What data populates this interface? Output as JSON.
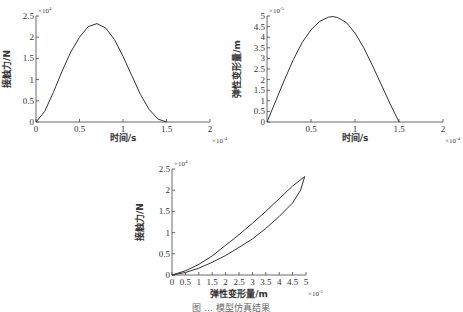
{
  "chart_data": [
    {
      "type": "line",
      "id": "force-vs-time",
      "title": "",
      "xlabel": "时间/s",
      "ylabel": "接触力/N",
      "x_multiplier": "×10^-4",
      "y_multiplier": "×10^4",
      "xlim": [
        0,
        2
      ],
      "ylim": [
        0,
        2.5
      ],
      "xticks": [
        "0",
        "0.5",
        "1",
        "1.5",
        "2"
      ],
      "yticks": [
        "0",
        "0.5",
        "1",
        "1.5",
        "2",
        "2.5"
      ],
      "grid": false,
      "series": [
        {
          "name": "接触力",
          "x": [
            0,
            0.1,
            0.2,
            0.3,
            0.4,
            0.5,
            0.6,
            0.7,
            0.8,
            0.9,
            1.0,
            1.1,
            1.2,
            1.3,
            1.4,
            1.5
          ],
          "y": [
            0,
            0.25,
            0.7,
            1.2,
            1.65,
            2.0,
            2.25,
            2.32,
            2.22,
            1.95,
            1.55,
            1.1,
            0.65,
            0.3,
            0.07,
            0
          ]
        }
      ]
    },
    {
      "type": "line",
      "id": "deformation-vs-time",
      "title": "",
      "xlabel": "时间/s",
      "ylabel": "弹性变形量/m",
      "x_multiplier": "×10^-4",
      "y_multiplier": "×10^-5",
      "xlim": [
        0,
        2
      ],
      "ylim": [
        0,
        5
      ],
      "xticks": [
        "0.5",
        "1",
        "1.5",
        "2"
      ],
      "yticks": [
        "0",
        "0.5",
        "1",
        "1.5",
        "2",
        "2.5",
        "3",
        "3.5",
        "4",
        "4.5",
        "5"
      ],
      "grid": false,
      "series": [
        {
          "name": "弹性变形量",
          "x": [
            0,
            0.1,
            0.2,
            0.3,
            0.4,
            0.5,
            0.6,
            0.7,
            0.75,
            0.8,
            0.9,
            1.0,
            1.1,
            1.2,
            1.3,
            1.4,
            1.5
          ],
          "y": [
            0,
            1.0,
            2.0,
            2.95,
            3.75,
            4.35,
            4.75,
            4.95,
            4.97,
            4.93,
            4.7,
            4.2,
            3.5,
            2.65,
            1.75,
            0.85,
            0
          ]
        }
      ]
    },
    {
      "type": "line",
      "id": "force-vs-deformation",
      "title": "",
      "xlabel": "弹性变形量/m",
      "ylabel": "接触力/N",
      "x_multiplier": "×10^-5",
      "y_multiplier": "×10^4",
      "xlim": [
        0,
        5
      ],
      "ylim": [
        0,
        2.5
      ],
      "xticks": [
        "0",
        "0.5",
        "1",
        "1.5",
        "2",
        "2.5",
        "3",
        "3.5",
        "4",
        "4.5",
        "5"
      ],
      "yticks": [
        "0",
        "0.5",
        "1",
        "1.5",
        "2",
        "2.5"
      ],
      "grid": false,
      "series": [
        {
          "name": "加载",
          "x": [
            0,
            0.5,
            1.0,
            1.5,
            2.0,
            2.5,
            3.0,
            3.5,
            4.0,
            4.5,
            4.95
          ],
          "y": [
            0,
            0.1,
            0.25,
            0.45,
            0.7,
            0.95,
            1.22,
            1.5,
            1.8,
            2.1,
            2.32
          ]
        },
        {
          "name": "卸载",
          "x": [
            4.95,
            4.8,
            4.5,
            4.0,
            3.5,
            3.0,
            2.5,
            2.0,
            1.5,
            1.0,
            0.5,
            0
          ],
          "y": [
            2.32,
            2.0,
            1.7,
            1.38,
            1.1,
            0.85,
            0.65,
            0.46,
            0.3,
            0.16,
            0.06,
            0
          ]
        }
      ]
    }
  ],
  "caption": "图 ... 模型仿真结果"
}
